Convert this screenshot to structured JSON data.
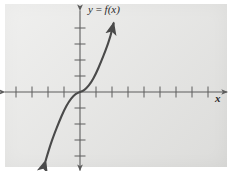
{
  "figure": {
    "panel_color": "#e3e3e1",
    "background_color": "#ffffff",
    "ink_color": "#5a5a5a",
    "curve_color": "#4a4a4a"
  },
  "labels": {
    "function_label": "y = f(x)",
    "function_label_y": "y",
    "function_label_eq": " = ",
    "function_label_f": "f(x)",
    "x_axis_label": "x"
  },
  "chart_data": {
    "type": "line",
    "title": "y = f(x)",
    "xlabel": "x",
    "ylabel": "",
    "grid": false,
    "legend": null,
    "axes": {
      "origin_px": [
        80,
        92
      ],
      "unit_px": 16,
      "xlim": [
        -4.7,
        9.2
      ],
      "ylim": [
        -4.9,
        5.1
      ],
      "x_ticks": [
        -4,
        -3,
        -2,
        -1,
        1,
        2,
        3,
        4,
        5,
        6,
        7,
        8
      ],
      "y_ticks": [
        -4,
        -3,
        -2,
        -1,
        1,
        2,
        3,
        4
      ],
      "x_tick_count_left": 4,
      "x_tick_count_right": 8,
      "y_tick_count_above": 4,
      "y_tick_count_below": 4,
      "x_axis_arrows": [
        "left",
        "right"
      ],
      "y_axis_arrows": [
        "up",
        "down"
      ]
    },
    "series": [
      {
        "name": "f(x)",
        "shape": "cubic",
        "equation_hint": "y = x^3",
        "arrow_ends": [
          "start",
          "end"
        ],
        "x": [
          -2.15,
          -1.9,
          -1.6,
          -1.3,
          -1.0,
          -0.7,
          -0.4,
          -0.15,
          0.0,
          0.15,
          0.4,
          0.7,
          1.0,
          1.3,
          1.6,
          1.9,
          2.1
        ],
        "y": [
          -4.3,
          -3.45,
          -2.6,
          -1.85,
          -1.15,
          -0.6,
          -0.22,
          -0.05,
          0.0,
          0.05,
          0.22,
          0.6,
          1.15,
          1.85,
          2.6,
          3.45,
          4.3
        ]
      }
    ]
  }
}
